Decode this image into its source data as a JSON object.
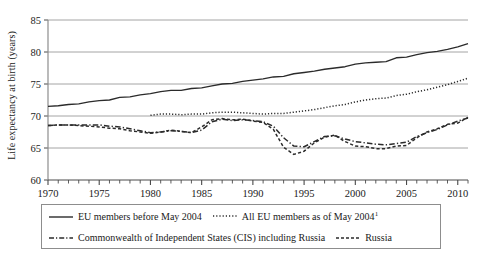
{
  "chart_data": {
    "type": "line",
    "title": "",
    "xlabel": "",
    "ylabel": "Life expectancy at birth (years)",
    "xlim": [
      1970,
      2011
    ],
    "ylim": [
      60,
      85
    ],
    "xticks": [
      1970,
      1975,
      1980,
      1985,
      1990,
      1995,
      2000,
      2005,
      2010
    ],
    "xtick_labels": [
      "1970",
      "1975",
      "1980",
      "1985",
      "1990",
      "1995",
      "2000",
      "2005",
      "2010"
    ],
    "xminor_step": 1,
    "yticks": [
      60,
      65,
      70,
      75,
      80,
      85
    ],
    "ytick_labels": [
      "60",
      "65",
      "70",
      "75",
      "80",
      "85"
    ],
    "grid": "horizontal",
    "legend_position": "below-plot",
    "series": [
      {
        "name": "EU members before May 2004",
        "style": "solid",
        "color": "#2b2b2b",
        "x": [
          1970,
          1971,
          1972,
          1973,
          1974,
          1975,
          1976,
          1977,
          1978,
          1979,
          1980,
          1981,
          1982,
          1983,
          1984,
          1985,
          1986,
          1987,
          1988,
          1989,
          1990,
          1991,
          1992,
          1993,
          1994,
          1995,
          1996,
          1997,
          1998,
          1999,
          2000,
          2001,
          2002,
          2003,
          2004,
          2005,
          2006,
          2007,
          2008,
          2009,
          2010,
          2011
        ],
        "values": [
          71.5,
          71.6,
          71.8,
          71.9,
          72.2,
          72.4,
          72.5,
          72.9,
          73.0,
          73.3,
          73.5,
          73.8,
          74.0,
          74.0,
          74.3,
          74.4,
          74.7,
          75.0,
          75.1,
          75.4,
          75.6,
          75.8,
          76.1,
          76.2,
          76.6,
          76.8,
          77.0,
          77.3,
          77.5,
          77.7,
          78.1,
          78.3,
          78.4,
          78.5,
          79.1,
          79.2,
          79.6,
          79.9,
          80.1,
          80.4,
          80.8,
          81.3
        ]
      },
      {
        "name": "All EU members as of May 2004",
        "style": "dotted",
        "color": "#2b2b2b",
        "x": [
          1980,
          1981,
          1982,
          1983,
          1984,
          1985,
          1986,
          1987,
          1988,
          1989,
          1990,
          1991,
          1992,
          1993,
          1994,
          1995,
          1996,
          1997,
          1998,
          1999,
          2000,
          2001,
          2002,
          2003,
          2004,
          2005,
          2006,
          2007,
          2008,
          2009,
          2010,
          2011
        ],
        "values": [
          70.1,
          70.3,
          70.3,
          70.2,
          70.3,
          70.3,
          70.5,
          70.6,
          70.6,
          70.5,
          70.4,
          70.3,
          70.4,
          70.4,
          70.6,
          70.8,
          71.0,
          71.3,
          71.6,
          71.8,
          72.2,
          72.5,
          72.7,
          72.8,
          73.2,
          73.4,
          73.8,
          74.1,
          74.5,
          74.9,
          75.4,
          75.9
        ]
      },
      {
        "name": "Commonwealth of Independent States (CIS) including Russia",
        "style": "dash-dot",
        "color": "#2b2b2b",
        "x": [
          1970,
          1971,
          1972,
          1973,
          1974,
          1975,
          1976,
          1977,
          1978,
          1979,
          1980,
          1981,
          1982,
          1983,
          1984,
          1985,
          1986,
          1987,
          1988,
          1989,
          1990,
          1991,
          1992,
          1993,
          1994,
          1995,
          1996,
          1997,
          1998,
          1999,
          2000,
          2001,
          2002,
          2003,
          2004,
          2005,
          2006,
          2007,
          2008,
          2009,
          2010,
          2011
        ],
        "values": [
          68.5,
          68.6,
          68.6,
          68.6,
          68.6,
          68.6,
          68.4,
          68.3,
          68.0,
          67.7,
          67.4,
          67.5,
          67.7,
          67.6,
          67.4,
          67.8,
          69.1,
          69.5,
          69.3,
          69.4,
          69.3,
          69.1,
          68.4,
          66.6,
          65.3,
          65.2,
          66.0,
          66.8,
          66.9,
          66.4,
          66.0,
          65.8,
          65.6,
          65.5,
          65.7,
          65.9,
          66.8,
          67.4,
          67.9,
          68.6,
          69.2,
          69.7
        ]
      },
      {
        "name": "Russia",
        "style": "dashed",
        "color": "#2b2b2b",
        "x": [
          1970,
          1971,
          1972,
          1973,
          1974,
          1975,
          1976,
          1977,
          1978,
          1979,
          1980,
          1981,
          1982,
          1983,
          1984,
          1985,
          1986,
          1987,
          1988,
          1989,
          1990,
          1991,
          1992,
          1993,
          1994,
          1995,
          1996,
          1997,
          1998,
          1999,
          2000,
          2001,
          2002,
          2003,
          2004,
          2005,
          2006,
          2007,
          2008,
          2009,
          2010,
          2011
        ],
        "values": [
          68.5,
          68.6,
          68.6,
          68.5,
          68.4,
          68.3,
          68.1,
          68.0,
          67.7,
          67.5,
          67.3,
          67.5,
          67.8,
          67.6,
          67.4,
          68.3,
          69.4,
          69.6,
          69.4,
          69.5,
          69.2,
          69.0,
          67.9,
          65.1,
          64.0,
          64.5,
          65.8,
          66.7,
          67.0,
          66.0,
          65.3,
          65.2,
          64.9,
          64.9,
          65.3,
          65.4,
          66.6,
          67.5,
          68.0,
          68.7,
          68.9,
          69.8
        ]
      }
    ]
  },
  "legend": {
    "entries": [
      {
        "label": "EU members before May 2004",
        "style": "solid",
        "superscript": ""
      },
      {
        "label": "All EU members as of May 2004",
        "style": "dotted",
        "superscript": "1"
      },
      {
        "label": "Commonwealth of Independent States (CIS) including Russia",
        "style": "dash-dot",
        "superscript": ""
      },
      {
        "label": "Russia",
        "style": "dashed",
        "superscript": ""
      }
    ]
  }
}
